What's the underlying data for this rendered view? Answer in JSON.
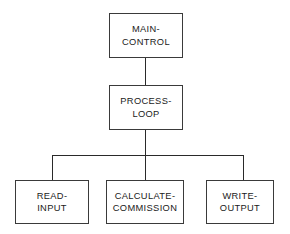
{
  "diagram": {
    "type": "structure-chart",
    "title": "",
    "background_color": "#ffffff",
    "line_color": "#3a3a3a",
    "text_color": "#1a1a1a",
    "nodes": [
      {
        "id": "main-control",
        "level": 0,
        "line1": "MAIN-",
        "line2": "CONTROL",
        "x": 109,
        "y": 13,
        "w": 74,
        "h": 45
      },
      {
        "id": "process-loop",
        "level": 1,
        "line1": "PROCESS-",
        "line2": "LOOP",
        "x": 109,
        "y": 85,
        "w": 74,
        "h": 45
      },
      {
        "id": "read-input",
        "level": 2,
        "line1": "READ-",
        "line2": "INPUT",
        "x": 15,
        "y": 180,
        "w": 74,
        "h": 44
      },
      {
        "id": "calculate-commission",
        "level": 2,
        "line1": "CALCULATE-",
        "line2": "COMMISSION",
        "x": 106,
        "y": 180,
        "w": 78,
        "h": 44
      },
      {
        "id": "write-output",
        "level": 2,
        "line1": "WRITE-",
        "line2": "OUTPUT",
        "x": 206,
        "y": 180,
        "w": 68,
        "h": 44
      }
    ],
    "connectors": [
      {
        "id": "main-to-process",
        "orientation": "v",
        "x": 145,
        "y": 58,
        "length": 27
      },
      {
        "id": "process-to-bus",
        "orientation": "v",
        "x": 145,
        "y": 130,
        "length": 25
      },
      {
        "id": "child-bus",
        "orientation": "h",
        "x": 52,
        "y": 155,
        "length": 192
      },
      {
        "id": "bus-to-read-input",
        "orientation": "v",
        "x": 52,
        "y": 155,
        "length": 25
      },
      {
        "id": "bus-to-calculate-commission",
        "orientation": "v",
        "x": 145,
        "y": 155,
        "length": 25
      },
      {
        "id": "bus-to-write-output",
        "orientation": "v",
        "x": 243,
        "y": 155,
        "length": 25
      }
    ]
  }
}
